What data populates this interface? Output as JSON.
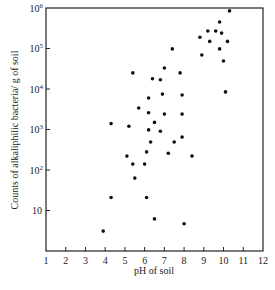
{
  "chart_data": {
    "type": "scatter",
    "title": "",
    "xlabel": "pH of soil",
    "ylabel": "Counts of alkaliphilic bacteria/ g of soil",
    "xlim": [
      1,
      12
    ],
    "ylim": [
      1,
      1000000
    ],
    "yscale": "log",
    "grid": false,
    "legend": "none",
    "x_ticks": [
      1,
      2,
      3,
      4,
      5,
      6,
      7,
      8,
      9,
      10,
      11,
      12
    ],
    "x_tick_labels": [
      "1",
      "2",
      "3",
      "4",
      "5",
      "6",
      "7",
      "8",
      "9",
      "10",
      "11",
      "12"
    ],
    "y_ticks": [
      10,
      100,
      1000,
      10000,
      100000,
      1000000
    ],
    "y_tick_labels": [
      {
        "base": "10",
        "exp": ""
      },
      {
        "base": "10",
        "exp": "2"
      },
      {
        "base": "10",
        "exp": "3"
      },
      {
        "base": "10",
        "exp": "4"
      },
      {
        "base": "10",
        "exp": "5"
      },
      {
        "base": "10",
        "exp": "6"
      }
    ],
    "points": [
      {
        "x": 10.3,
        "y": 850000
      },
      {
        "x": 9.8,
        "y": 450000
      },
      {
        "x": 9.2,
        "y": 270000
      },
      {
        "x": 9.6,
        "y": 270000
      },
      {
        "x": 9.9,
        "y": 240000
      },
      {
        "x": 8.8,
        "y": 190000
      },
      {
        "x": 9.3,
        "y": 150000
      },
      {
        "x": 10.2,
        "y": 150000
      },
      {
        "x": 9.8,
        "y": 98000
      },
      {
        "x": 7.4,
        "y": 98000
      },
      {
        "x": 8.9,
        "y": 69000
      },
      {
        "x": 10.0,
        "y": 49000
      },
      {
        "x": 7.0,
        "y": 33000
      },
      {
        "x": 5.4,
        "y": 25000
      },
      {
        "x": 7.8,
        "y": 25000
      },
      {
        "x": 6.4,
        "y": 18000
      },
      {
        "x": 6.8,
        "y": 17000
      },
      {
        "x": 10.1,
        "y": 8500
      },
      {
        "x": 6.9,
        "y": 7500
      },
      {
        "x": 7.9,
        "y": 7100
      },
      {
        "x": 6.2,
        "y": 6000
      },
      {
        "x": 5.7,
        "y": 3400
      },
      {
        "x": 6.2,
        "y": 2600
      },
      {
        "x": 7.0,
        "y": 2400
      },
      {
        "x": 7.9,
        "y": 2400
      },
      {
        "x": 6.5,
        "y": 1500
      },
      {
        "x": 4.3,
        "y": 1400
      },
      {
        "x": 5.2,
        "y": 1200
      },
      {
        "x": 6.2,
        "y": 980
      },
      {
        "x": 6.8,
        "y": 910
      },
      {
        "x": 6.3,
        "y": 490
      },
      {
        "x": 7.5,
        "y": 490
      },
      {
        "x": 7.9,
        "y": 650
      },
      {
        "x": 5.1,
        "y": 220
      },
      {
        "x": 6.1,
        "y": 280
      },
      {
        "x": 7.2,
        "y": 260
      },
      {
        "x": 8.4,
        "y": 220
      },
      {
        "x": 5.4,
        "y": 140
      },
      {
        "x": 6.0,
        "y": 140
      },
      {
        "x": 5.5,
        "y": 63
      },
      {
        "x": 4.3,
        "y": 21
      },
      {
        "x": 6.1,
        "y": 21
      },
      {
        "x": 6.5,
        "y": 6.2
      },
      {
        "x": 8.0,
        "y": 4.7
      },
      {
        "x": 3.9,
        "y": 3.1
      }
    ]
  }
}
